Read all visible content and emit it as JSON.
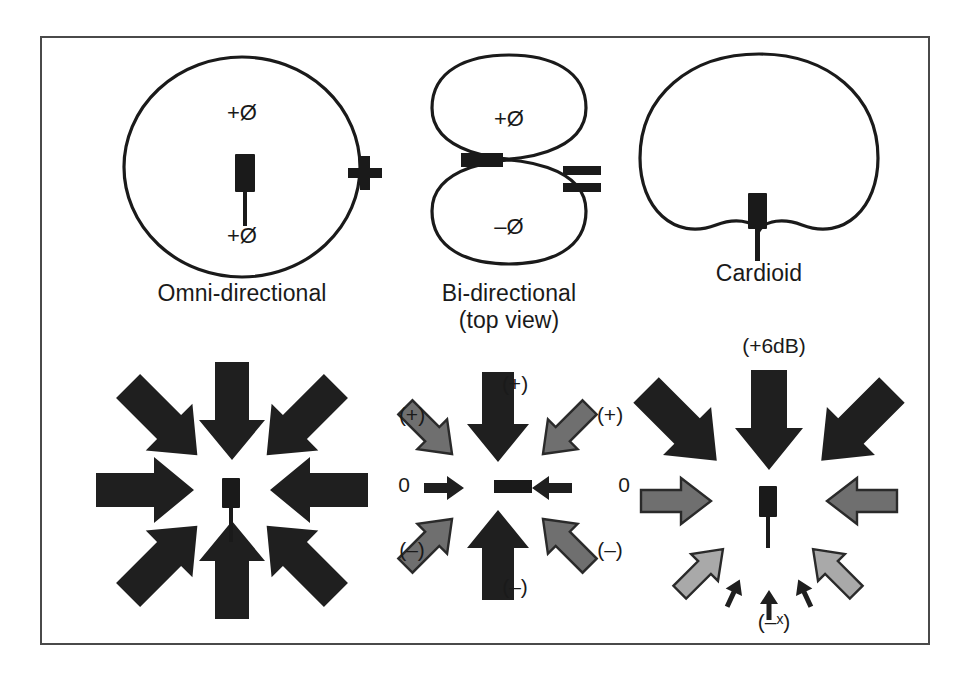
{
  "figure": {
    "equation": {
      "plus": "+",
      "equals": "="
    }
  },
  "polar_row": {
    "omni": {
      "caption": "Omni-directional",
      "caption_line2": "",
      "phase_top": "+Ø",
      "phase_bottom": "+Ø",
      "shape": "circle"
    },
    "bidirectional": {
      "caption": "Bi-directional",
      "caption_line2": "(top view)",
      "phase_top": "+Ø",
      "phase_bottom": "–Ø",
      "shape": "figure-eight"
    },
    "cardioid": {
      "caption": "Cardioid",
      "caption_line2": "",
      "shape": "cardioid"
    }
  },
  "arrow_row": {
    "omni": {
      "arrows": [
        {
          "angle": "N",
          "shade": "black",
          "label": ""
        },
        {
          "angle": "NE",
          "shade": "black",
          "label": ""
        },
        {
          "angle": "E",
          "shade": "black",
          "label": ""
        },
        {
          "angle": "SE",
          "shade": "black",
          "label": ""
        },
        {
          "angle": "S",
          "shade": "black",
          "label": ""
        },
        {
          "angle": "SW",
          "shade": "black",
          "label": ""
        },
        {
          "angle": "W",
          "shade": "black",
          "label": ""
        },
        {
          "angle": "NW",
          "shade": "black",
          "label": ""
        }
      ]
    },
    "bidirectional": {
      "label_top": "(+)",
      "label_top_left": "(+)",
      "label_top_right": "(+)",
      "label_left": "0",
      "label_right": "0",
      "label_bottom": "(–)",
      "label_bottom_left": "(–)",
      "label_bottom_right": "(–)"
    },
    "cardioid": {
      "label_top": "(+6dB)",
      "label_bottom": "(–ˣ)"
    }
  },
  "colors": {
    "ink": "#1a1a1a",
    "frame": "#4a4a4a",
    "arrow_black": "#1f1f1f",
    "arrow_mid_gray": "#6f6f6f",
    "arrow_light_gray": "#a9a9a9",
    "arrow_outline": "#2a2a2a",
    "background": "#ffffff"
  }
}
